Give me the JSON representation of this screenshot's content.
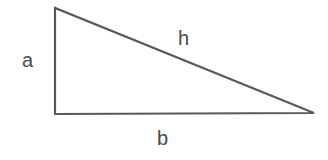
{
  "diagram": {
    "type": "right-triangle",
    "labels": {
      "vertical_side": "a",
      "hypotenuse": "h",
      "horizontal_side": "b"
    },
    "colors": {
      "stroke": "#555555",
      "text": "#4a4a4a",
      "background": "#ffffff"
    }
  }
}
